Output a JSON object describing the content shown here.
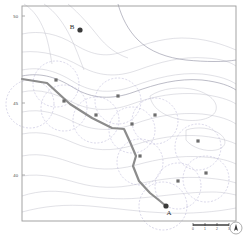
{
  "figure": {
    "kind": "contour-route-map",
    "background_color": "#ffffff",
    "frame_color": "#9a9a9a"
  },
  "axes": {
    "y_ticks": [
      {
        "label": "50",
        "y": 16
      },
      {
        "label": "45",
        "y": 103
      },
      {
        "label": "40",
        "y": 175
      }
    ],
    "x_ticks": [],
    "frame": {
      "x": 22,
      "y": 6,
      "width": 214,
      "height": 215
    }
  },
  "points": [
    {
      "name": "B",
      "label": "B",
      "x": 80,
      "y": 30,
      "label_dx": -8,
      "label_dy": -1
    },
    {
      "name": "A",
      "label": "A",
      "x": 166,
      "y": 206,
      "label_dx": 3,
      "label_dy": 9
    }
  ],
  "route": {
    "color": "#8c8c8c",
    "width": 2.2,
    "points": [
      [
        22,
        79
      ],
      [
        47,
        83
      ],
      [
        70,
        104
      ],
      [
        92,
        118
      ],
      [
        112,
        128
      ],
      [
        124,
        129
      ],
      [
        130,
        142
      ],
      [
        136,
        156
      ],
      [
        133,
        166
      ],
      [
        139,
        181
      ],
      [
        150,
        193
      ],
      [
        160,
        201
      ],
      [
        166,
        206
      ]
    ]
  },
  "coverage_circles": {
    "stroke": "#b9b6d6",
    "dash": "2,1.6",
    "circles": [
      {
        "cx": 30,
        "cy": 104,
        "r": 24
      },
      {
        "cx": 56,
        "cy": 84,
        "r": 23
      },
      {
        "cx": 64,
        "cy": 108,
        "r": 23
      },
      {
        "cx": 96,
        "cy": 120,
        "r": 23
      },
      {
        "cx": 118,
        "cy": 101,
        "r": 23
      },
      {
        "cx": 132,
        "cy": 130,
        "r": 23
      },
      {
        "cx": 140,
        "cy": 162,
        "r": 23
      },
      {
        "cx": 155,
        "cy": 121,
        "r": 23
      },
      {
        "cx": 163,
        "cy": 206,
        "r": 24
      },
      {
        "cx": 178,
        "cy": 186,
        "r": 23
      },
      {
        "cx": 198,
        "cy": 147,
        "r": 23
      },
      {
        "cx": 206,
        "cy": 179,
        "r": 23
      }
    ]
  },
  "waypoints": {
    "fill": "#6d6d6d",
    "markers": [
      [
        56,
        80
      ],
      [
        64,
        101
      ],
      [
        96,
        115
      ],
      [
        118,
        96
      ],
      [
        132,
        124
      ],
      [
        140,
        156
      ],
      [
        155,
        115
      ],
      [
        178,
        181
      ],
      [
        198,
        141
      ],
      [
        206,
        173
      ]
    ]
  },
  "contours": {
    "color": "#b3b3bf",
    "accent_color": "#8a8a9c",
    "levels": 12
  },
  "scale_bar": {
    "x": 193,
    "y": 225,
    "width": 36,
    "ticks": [
      "0",
      "1",
      "2",
      "3"
    ]
  },
  "compass": {
    "name": "north-arrow",
    "x": 236,
    "y": 228,
    "r": 6,
    "label": "N"
  }
}
